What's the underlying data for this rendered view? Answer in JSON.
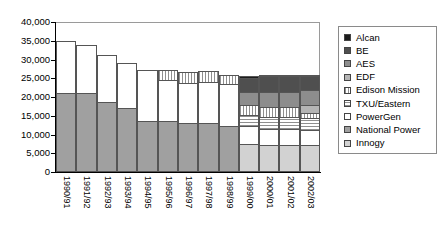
{
  "chart_data": {
    "type": "bar",
    "subtype": "stacked-vertical",
    "title": "",
    "xlabel": "",
    "ylabel": "",
    "ylim": [
      0,
      40000
    ],
    "ytick_step": 5000,
    "yticks": [
      "0",
      "5,000",
      "10,000",
      "15,000",
      "20,000",
      "25,000",
      "30,000",
      "35,000",
      "40,000"
    ],
    "ytick_values": [
      0,
      5000,
      10000,
      15000,
      20000,
      25000,
      30000,
      35000,
      40000
    ],
    "grid": false,
    "legend_position": "right",
    "categories": [
      "1990/91",
      "1991/92",
      "1992/93",
      "1993/94",
      "1994/95",
      "1995/96",
      "1996/97",
      "1997/98",
      "1998/99",
      "1999/00",
      "2000/01",
      "2001/02",
      "2002/03"
    ],
    "series": [
      {
        "name": "Alcan",
        "fill": "f-alcan",
        "color": "#1c1c1c",
        "values": [
          0,
          0,
          0,
          0,
          0,
          0,
          0,
          0,
          0,
          500,
          500,
          500,
          500
        ]
      },
      {
        "name": "BE",
        "fill": "f-be",
        "color": "#4f4f4f",
        "values": [
          0,
          0,
          0,
          0,
          0,
          0,
          0,
          0,
          0,
          3700,
          4200,
          4200,
          3700
        ]
      },
      {
        "name": "AES",
        "fill": "f-aes",
        "color": "#8d8d8d",
        "values": [
          0,
          0,
          0,
          0,
          0,
          0,
          0,
          0,
          0,
          3600,
          4000,
          4000,
          4000
        ]
      },
      {
        "name": "EDF",
        "fill": "f-edf",
        "color": "#b5b5b5",
        "values": [
          0,
          0,
          0,
          0,
          0,
          0,
          0,
          0,
          0,
          0,
          0,
          0,
          2000
        ]
      },
      {
        "name": "Edison Mission",
        "fill": "f-edison",
        "color": "#8f8f8f",
        "values": [
          0,
          0,
          0,
          0,
          0,
          2700,
          3000,
          2800,
          2600,
          2600,
          2600,
          2600,
          1400
        ]
      },
      {
        "name": "TXU/Eastern",
        "fill": "f-txu",
        "color": "#8f8f8f",
        "values": [
          0,
          0,
          0,
          0,
          0,
          0,
          0,
          0,
          0,
          3000,
          3100,
          3100,
          3100
        ]
      },
      {
        "name": "PowerGen",
        "fill": "f-powergen",
        "color": "#ffffff",
        "values": [
          14000,
          13000,
          12400,
          12200,
          13600,
          11000,
          10800,
          11100,
          11000,
          4700,
          4300,
          4300,
          4100
        ]
      },
      {
        "name": "National Power",
        "fill": "f-national",
        "color": "#a0a0a0",
        "values": [
          21000,
          21000,
          18800,
          17000,
          13700,
          13500,
          13000,
          13000,
          12400,
          0,
          0,
          0,
          0
        ]
      },
      {
        "name": "Innogy",
        "fill": "f-innogy",
        "color": "#d2d2d2",
        "values": [
          0,
          0,
          0,
          0,
          0,
          0,
          0,
          0,
          0,
          7500,
          7300,
          7300,
          7200
        ]
      }
    ],
    "totals": [
      35000,
      34000,
      31200,
      29200,
      27300,
      27200,
      26800,
      26900,
      26000,
      25600,
      26000,
      26000,
      26000
    ]
  },
  "legend": {
    "items": [
      {
        "label": "Alcan"
      },
      {
        "label": "BE"
      },
      {
        "label": "AES"
      },
      {
        "label": "EDF"
      },
      {
        "label": "Edison Mission"
      },
      {
        "label": "TXU/Eastern"
      },
      {
        "label": "PowerGen"
      },
      {
        "label": "National Power"
      },
      {
        "label": "Innogy"
      }
    ]
  }
}
